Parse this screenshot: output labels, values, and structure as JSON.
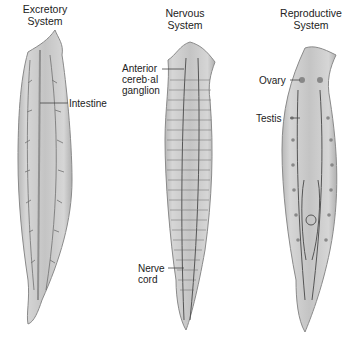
{
  "diagram": {
    "panels": [
      {
        "id": "excretory",
        "title_line1": "Excretory",
        "title_line2": "System",
        "labels": [
          {
            "text": "Intestine"
          }
        ]
      },
      {
        "id": "nervous",
        "title_line1": "Nervous",
        "title_line2": "System",
        "labels": [
          {
            "line1": "Anterior",
            "line2": "cereb·al",
            "line3": "ganglion"
          },
          {
            "line1": "Nerve",
            "line2": "cord"
          }
        ]
      },
      {
        "id": "reproductive",
        "title_line1": "Reproductive",
        "title_line2": "System",
        "labels": [
          {
            "text": "Ovary"
          },
          {
            "text": "Testis"
          }
        ]
      }
    ],
    "colors": {
      "body_fill": "#c9c9c9",
      "body_edge": "#8a8a8a",
      "structure": "#555555",
      "label_text": "#222222"
    }
  }
}
